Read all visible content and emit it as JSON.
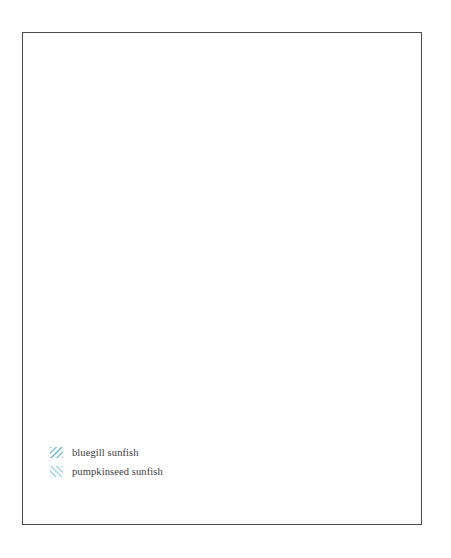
{
  "figure": {
    "type": "distribution-range-map",
    "region": "North America",
    "background_color": "#ffffff",
    "frame_color": "#4a4a4d",
    "coastline_color": "#3a3a3e",
    "border_color": "#77777d"
  },
  "legend": {
    "position": "bottom-left",
    "items": [
      {
        "label": "bluegill sunfish",
        "pattern": "diagonal-hatch-forward",
        "color": "#49a8d8",
        "swatch_icon": "hatch-swatch-icon"
      },
      {
        "label": "pumpkinseed sunfish",
        "pattern": "diagonal-hatch-backward",
        "color": "#7cc7e6",
        "swatch_icon": "hatch-swatch-icon"
      }
    ]
  },
  "map_data": {
    "series": [
      {
        "name": "bluegill sunfish",
        "pattern": "forward-hatch",
        "color": "#49a8d8",
        "extent_note": "eastern and central United States from the Great Lakes and New England south to Florida and west to the Great Plains, with introduced patches in the Pacific Northwest and northern Rockies"
      },
      {
        "name": "pumpkinseed sunfish",
        "pattern": "backward-hatch",
        "color": "#7cc7e6",
        "extent_note": "Great Lakes basin, New England and the Atlantic seaboard south to the Carolinas and Georgia, extending west through the upper Midwest, with introduced patches in the Pacific Northwest"
      }
    ],
    "overlap_note": "cross-hatched area shows where both species occur",
    "unshaded_note": "Canada north of the Great Lakes, western United States, Mexico, Central America and the Caribbean islands are unshaded"
  }
}
